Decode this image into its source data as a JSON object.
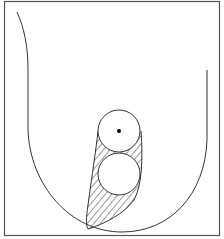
{
  "figure": {
    "width": 224,
    "height": 239,
    "stroke_color": "#333333",
    "background": "#ffffff",
    "frame": {
      "x": 4,
      "y": 1,
      "w": 216,
      "h": 235
    },
    "elements": [
      {
        "name": "u-shaped-outer-curve"
      },
      {
        "name": "hatched-teardrop-region"
      },
      {
        "name": "upper-circle",
        "cx": 119,
        "cy": 131,
        "r": 21
      },
      {
        "name": "center-dot",
        "cx": 119,
        "cy": 131,
        "r": 2
      },
      {
        "name": "lower-circle",
        "cx": 119,
        "cy": 174,
        "r": 21
      }
    ]
  }
}
